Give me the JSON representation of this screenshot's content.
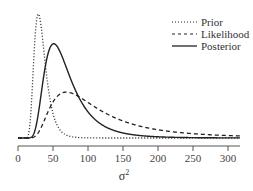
{
  "chart_data": {
    "type": "line",
    "title": "",
    "xlabel": "σ²",
    "ylabel": "",
    "xlim": [
      0,
      315
    ],
    "xticks": [
      0,
      50,
      100,
      150,
      200,
      250,
      300
    ],
    "grid": false,
    "legend_position": "upper right",
    "y_axis_shown": false,
    "series": [
      {
        "name": "Prior",
        "style": "dotted",
        "mode": 29,
        "relative_peak_height": 1.0,
        "shape": "inverse-gamma",
        "alpha": 12
      },
      {
        "name": "Likelihood",
        "style": "dashed",
        "mode": 69,
        "relative_peak_height": 0.37,
        "shape": "inverse-gamma",
        "alpha": 3.2
      },
      {
        "name": "Posterior",
        "style": "solid",
        "mode": 51,
        "relative_peak_height": 0.76,
        "shape": "inverse-gamma",
        "alpha": 6
      }
    ]
  },
  "legend": {
    "items": [
      {
        "label": "Prior",
        "style": "dotted"
      },
      {
        "label": "Likelihood",
        "style": "dashed"
      },
      {
        "label": "Posterior",
        "style": "solid"
      }
    ]
  },
  "axis": {
    "x_title": "σ",
    "x_title_sup": "2",
    "tick_labels": [
      "0",
      "50",
      "100",
      "150",
      "200",
      "250",
      "300"
    ]
  },
  "colors": {
    "line": "#222222",
    "axis": "#555555"
  }
}
